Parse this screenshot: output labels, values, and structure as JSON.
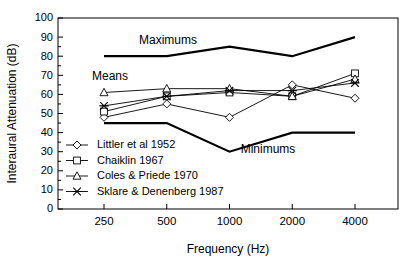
{
  "chart_data": {
    "type": "line",
    "title": "",
    "xlabel": "Frequency (Hz)",
    "ylabel": "Interaural Attenuation (dB)",
    "x": [
      250,
      500,
      1000,
      2000,
      4000
    ],
    "categories": [
      "250",
      "500",
      "1000",
      "2000",
      "4000"
    ],
    "xtick_labels": [
      "250",
      "500",
      "1000",
      "2000",
      "4000"
    ],
    "ytick_labels": [
      "0",
      "10",
      "20",
      "30",
      "40",
      "50",
      "60",
      "70",
      "80",
      "90",
      "100"
    ],
    "ytick_values": [
      0,
      10,
      20,
      30,
      40,
      50,
      60,
      70,
      80,
      90,
      100
    ],
    "ylim": [
      0,
      100
    ],
    "grid": false,
    "legend_position": "inside-lower-left",
    "series": [
      {
        "name": "Littler et al 1952",
        "marker": "diamond",
        "values": [
          48,
          55,
          48,
          65,
          58
        ]
      },
      {
        "name": "Chaiklin 1967",
        "marker": "square",
        "values": [
          51,
          59,
          61,
          59,
          71
        ]
      },
      {
        "name": "Coles & Priede 1970",
        "marker": "triangle",
        "values": [
          61,
          63,
          63,
          59,
          68
        ]
      },
      {
        "name": "Sklare & Denenberg 1987",
        "marker": "cross",
        "values": [
          54,
          59,
          62,
          62,
          66
        ]
      }
    ],
    "envelopes": [
      {
        "name": "Maximums",
        "label": "Maximums",
        "values": [
          80,
          80,
          85,
          80,
          90
        ]
      },
      {
        "name": "Minimums",
        "label": "Minimums",
        "values": [
          45,
          45,
          30,
          40,
          40
        ]
      }
    ],
    "annotations": [
      {
        "name": "maximums-label",
        "text": "Maximums"
      },
      {
        "name": "means-label",
        "text": "Means"
      },
      {
        "name": "minimums-label",
        "text": "Minimums"
      }
    ]
  },
  "legend": {
    "items": [
      {
        "label": "Littler et al 1952",
        "marker": "diamond"
      },
      {
        "label": "Chaiklin 1967",
        "marker": "square"
      },
      {
        "label": "Coles & Priede 1970",
        "marker": "triangle"
      },
      {
        "label": "Sklare & Denenberg 1987",
        "marker": "cross"
      }
    ]
  },
  "colors": {
    "background": "#ffffff",
    "ink": "#000000",
    "marker_fill": "#ffffff"
  }
}
